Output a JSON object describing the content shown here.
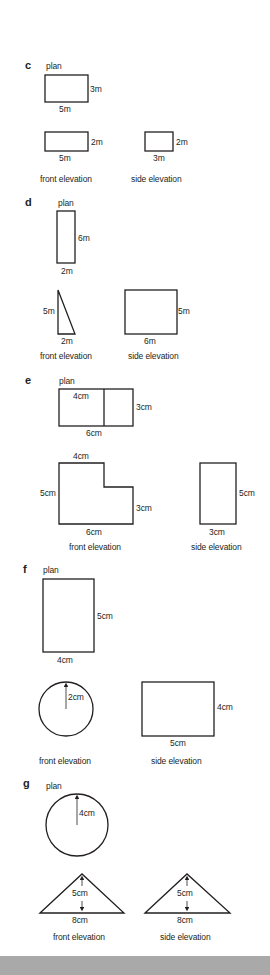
{
  "problems": [
    {
      "id": "c",
      "plan": {
        "caption": "plan",
        "width_label": "5m",
        "height_label": "3m"
      },
      "front_elevation": {
        "caption": "front elevation",
        "width_label": "5m",
        "height_label": "2m"
      },
      "side_elevation": {
        "caption": "side elevation",
        "width_label": "3m",
        "height_label": "2m"
      }
    },
    {
      "id": "d",
      "plan": {
        "caption": "plan",
        "width_label": "2m",
        "height_label": "6m"
      },
      "front_elevation": {
        "caption": "front elevation",
        "width_label": "2m",
        "height_label": "5m",
        "shape": "right-triangle"
      },
      "side_elevation": {
        "caption": "side elevation",
        "width_label": "6m",
        "height_label": "5m"
      }
    },
    {
      "id": "e",
      "plan": {
        "caption": "plan",
        "top_label": "4cm",
        "width_label": "6cm",
        "height_label": "3cm"
      },
      "front_elevation": {
        "caption": "front elevation",
        "top_label": "4cm",
        "left_label": "5cm",
        "right_label": "3cm",
        "width_label": "6cm",
        "shape": "L-shape"
      },
      "side_elevation": {
        "caption": "side elevation",
        "width_label": "3cm",
        "height_label": "5cm"
      }
    },
    {
      "id": "f",
      "plan": {
        "caption": "plan",
        "width_label": "4cm",
        "height_label": "5cm"
      },
      "front_elevation": {
        "caption": "front elevation",
        "radius_label": "2cm",
        "shape": "circle"
      },
      "side_elevation": {
        "caption": "side elevation",
        "width_label": "5cm",
        "height_label": "4cm"
      }
    },
    {
      "id": "g",
      "plan": {
        "caption": "plan",
        "radius_label": "4cm",
        "shape": "circle"
      },
      "front_elevation": {
        "caption": "front elevation",
        "width_label": "8cm",
        "height_label": "5cm",
        "shape": "isosceles-triangle"
      },
      "side_elevation": {
        "caption": "side elevation",
        "width_label": "8cm",
        "height_label": "5cm",
        "shape": "isosceles-triangle"
      }
    }
  ],
  "colors": {
    "line": "#231f20",
    "background": "#ffffff",
    "footer_band": "#a9a9a9"
  }
}
